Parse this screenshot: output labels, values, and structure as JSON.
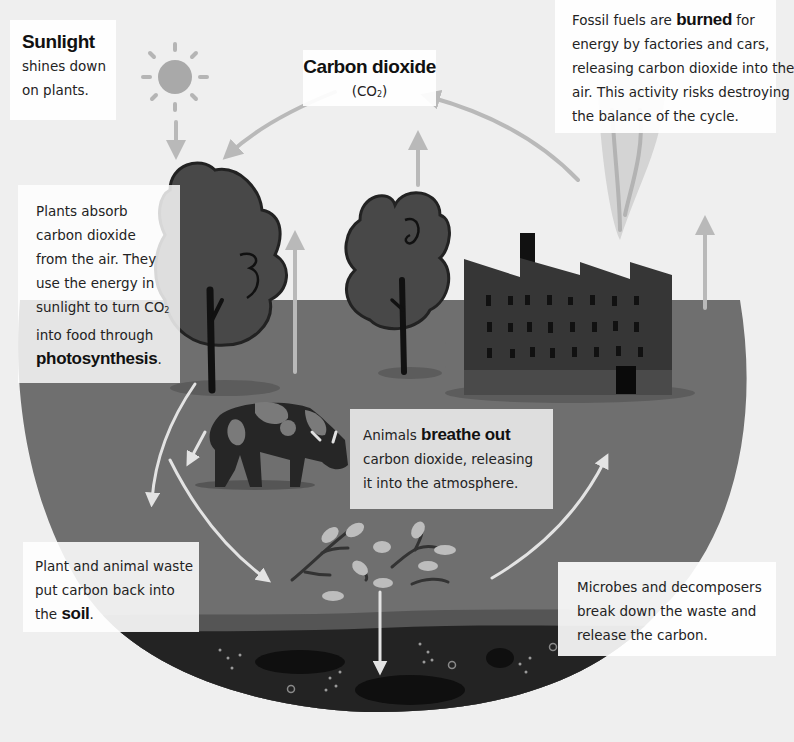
{
  "colors": {
    "background": "#efefef",
    "ground": "#6f6f6f",
    "ground_dark": "#5c5c5c",
    "soil": "#232323",
    "tree": "#484848",
    "factory": "#363636",
    "arrow": "#b9b9b9",
    "arrow_light": "#e3e3e3",
    "sun": "#a9a9a9"
  },
  "sunlight": {
    "title": "Sunlight",
    "lines": [
      "shines down",
      "on plants."
    ]
  },
  "carbon_dioxide": {
    "title": "Carbon dioxide",
    "formula_prefix": "(CO",
    "formula_sub": "2",
    "formula_suffix": ")"
  },
  "fossil_fuels": {
    "line1_pre": "Fossil fuels are ",
    "line1_bold": "burned",
    "line1_post": " for",
    "lines": [
      "energy by factories and cars,",
      "releasing carbon dioxide into the",
      "air. This activity risks destroying",
      "the balance of the cycle."
    ]
  },
  "plants": {
    "lines": [
      "Plants absorb",
      "carbon dioxide",
      "from the air. They",
      "use the energy in"
    ],
    "co2_line_pre": "sunlight to turn CO",
    "co2_line_sub": "2",
    "line6": "into food through",
    "bold": "photosynthesis",
    "bold_suffix": "."
  },
  "animals": {
    "line1_pre": "Animals ",
    "line1_bold": "breathe out",
    "lines": [
      "carbon dioxide, releasing",
      "it into the atmosphere."
    ]
  },
  "waste": {
    "lines": [
      "Plant and animal waste",
      "put carbon back into"
    ],
    "line3_pre": "the ",
    "line3_bold": "soil",
    "line3_post": "."
  },
  "microbes": {
    "lines": [
      "Microbes and decomposers",
      "break down the waste and",
      "release the carbon."
    ]
  }
}
